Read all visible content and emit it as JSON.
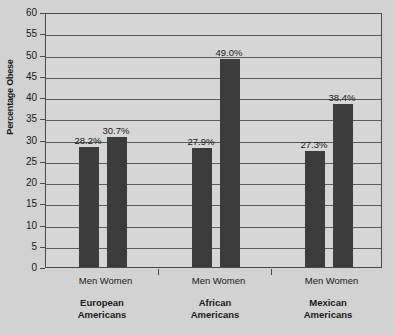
{
  "chart_data": {
    "type": "bar",
    "title": "",
    "xlabel": "",
    "ylabel": "Percentage Obese",
    "ylim": [
      0,
      60
    ],
    "ytick_step": 5,
    "yticks": [
      60,
      55,
      50,
      45,
      40,
      35,
      30,
      25,
      20,
      15,
      10,
      5,
      0
    ],
    "grid": true,
    "legend": "none",
    "categories": [
      "European Americans",
      "African Americans",
      "Mexican Americans"
    ],
    "subcategories": [
      "Men",
      "Women"
    ],
    "series": [
      {
        "name": "Men",
        "values": [
          28.2,
          27.9,
          27.3
        ],
        "labels": [
          "28.2%",
          "27.9%",
          "27.3%"
        ]
      },
      {
        "name": "Women",
        "values": [
          30.7,
          49.0,
          38.4
        ],
        "labels": [
          "30.7%",
          "49.0%",
          "38.4%"
        ]
      }
    ],
    "bar_color": "#3c3c3c",
    "plot_background": "#d6d6d6",
    "page_background": "#d2d2d2",
    "axis_color": "#4a4a4a"
  },
  "groups": [
    {
      "name": "European Americans",
      "line1": "European",
      "line2": "Americans",
      "bars": [
        {
          "sub": "Men",
          "value": 28.2,
          "label": "28.2%"
        },
        {
          "sub": "Women",
          "value": 30.7,
          "label": "30.7%"
        }
      ]
    },
    {
      "name": "African Americans",
      "line1": "African",
      "line2": "Americans",
      "bars": [
        {
          "sub": "Men",
          "value": 27.9,
          "label": "27.9%"
        },
        {
          "sub": "Women",
          "value": 49.0,
          "label": "49.0%"
        }
      ]
    },
    {
      "name": "Mexican Americans",
      "line1": "Mexican",
      "line2": "Americans",
      "bars": [
        {
          "sub": "Men",
          "value": 27.3,
          "label": "27.3%"
        },
        {
          "sub": "Women",
          "value": 38.4,
          "label": "38.4%"
        }
      ]
    }
  ],
  "axis": {
    "y_title": "Percentage Obese",
    "y_labels": [
      "60",
      "55",
      "50",
      "45",
      "40",
      "35",
      "30",
      "25",
      "20",
      "15",
      "10",
      "5",
      "0"
    ]
  }
}
